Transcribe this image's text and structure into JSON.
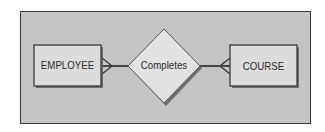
{
  "diagram": {
    "type": "entity-relationship",
    "frame": {
      "background": "#c4c4c4",
      "border": "#3a3a3a"
    },
    "entities": [
      {
        "id": "employee",
        "label": "EMPLOYEE"
      },
      {
        "id": "course",
        "label": "COURSE"
      }
    ],
    "relationships": [
      {
        "id": "completes",
        "label": "Completes",
        "from": "employee",
        "to": "course",
        "from_cardinality": "many",
        "to_cardinality": "many"
      }
    ],
    "colors": {
      "entity_fill": "#dcdcdc",
      "relationship_fill": "#e2e2e2",
      "line": "#3a3a3a",
      "shadow": "#6e6e6e"
    }
  }
}
